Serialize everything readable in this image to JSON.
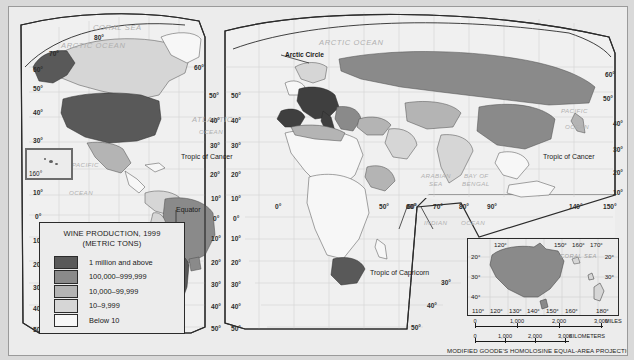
{
  "map": {
    "projection_note": "MODIFIED GOODE'S HOMOLOSINE EQUAL-AREA PROJECTION",
    "legend": {
      "title_line1": "WINE PRODUCTION, 1999",
      "title_line2": "(METRIC TONS)",
      "classes": [
        {
          "label": "1 million and above",
          "color": "#595959"
        },
        {
          "label": "100,000–999,999",
          "color": "#8a8a8a"
        },
        {
          "label": "10,000–99,999",
          "color": "#b4b4b4"
        },
        {
          "label": "10–9,999",
          "color": "#d6d6d6"
        },
        {
          "label": "Below 10",
          "color": "#f7f7f7"
        }
      ]
    },
    "ocean_labels": [
      {
        "text": "ARCTIC OCEAN",
        "x": 52,
        "y": 34
      },
      {
        "text": "ARCTIC OCEAN",
        "x": 310,
        "y": 31
      },
      {
        "text": "ATLANTIC",
        "x": 183,
        "y": 108
      },
      {
        "text": "OCEAN",
        "x": 190,
        "y": 121
      },
      {
        "text": "PACIFIC",
        "x": 63,
        "y": 154
      },
      {
        "text": "OCEAN",
        "x": 60,
        "y": 182
      },
      {
        "text": "PACIFIC",
        "x": 552,
        "y": 100
      },
      {
        "text": "OCEAN",
        "x": 556,
        "y": 116
      },
      {
        "text": "ARABIAN",
        "x": 412,
        "y": 165
      },
      {
        "text": "SEA",
        "x": 420,
        "y": 173
      },
      {
        "text": "BAY OF",
        "x": 455,
        "y": 165
      },
      {
        "text": "BENGAL",
        "x": 453,
        "y": 173
      },
      {
        "text": "INDIAN",
        "x": 415,
        "y": 212
      },
      {
        "text": "OCEAN",
        "x": 452,
        "y": 212
      },
      {
        "text": "CORAL SEA",
        "x": 84,
        "y": 16
      }
    ],
    "place_labels": [
      {
        "text": "Arctic Circle",
        "x": 276,
        "y": 44,
        "bold": true
      },
      {
        "text": "Tropic of Cancer",
        "x": 172,
        "y": 146
      },
      {
        "text": "Tropic of Cancer",
        "x": 534,
        "y": 146
      },
      {
        "text": "Tropic of Capricorn",
        "x": 361,
        "y": 262
      },
      {
        "text": "Equator",
        "x": 167,
        "y": 199
      }
    ],
    "graticule_labels": [
      {
        "text": "80°",
        "x": 85,
        "y": 27
      },
      {
        "text": "70°",
        "x": 40,
        "y": 43
      },
      {
        "text": "60°",
        "x": 24,
        "y": 59
      },
      {
        "text": "50°",
        "x": 24,
        "y": 78
      },
      {
        "text": "40°",
        "x": 24,
        "y": 102
      },
      {
        "text": "30°",
        "x": 24,
        "y": 130
      },
      {
        "text": "160°",
        "x": 18,
        "y": 160
      },
      {
        "text": "10°",
        "x": 24,
        "y": 182
      },
      {
        "text": "0°",
        "x": 26,
        "y": 206
      },
      {
        "text": "10°",
        "x": 24,
        "y": 230
      },
      {
        "text": "20°",
        "x": 24,
        "y": 254
      },
      {
        "text": "30°",
        "x": 24,
        "y": 277
      },
      {
        "text": "40°",
        "x": 24,
        "y": 298
      },
      {
        "text": "50°",
        "x": 24,
        "y": 319
      },
      {
        "text": "60°",
        "x": 185,
        "y": 57
      },
      {
        "text": "50°",
        "x": 200,
        "y": 85
      },
      {
        "text": "40°",
        "x": 201,
        "y": 110
      },
      {
        "text": "30°",
        "x": 201,
        "y": 135
      },
      {
        "text": "20°",
        "x": 201,
        "y": 164
      },
      {
        "text": "10°",
        "x": 202,
        "y": 188
      },
      {
        "text": "0°",
        "x": 204,
        "y": 208
      },
      {
        "text": "10°",
        "x": 202,
        "y": 228
      },
      {
        "text": "20°",
        "x": 202,
        "y": 252
      },
      {
        "text": "30°",
        "x": 202,
        "y": 274
      },
      {
        "text": "40°",
        "x": 202,
        "y": 296
      },
      {
        "text": "50°",
        "x": 202,
        "y": 318
      },
      {
        "text": "50°",
        "x": 222,
        "y": 85
      },
      {
        "text": "40°",
        "x": 222,
        "y": 110
      },
      {
        "text": "30°",
        "x": 222,
        "y": 135
      },
      {
        "text": "20°",
        "x": 222,
        "y": 164
      },
      {
        "text": "10°",
        "x": 222,
        "y": 188
      },
      {
        "text": "0°",
        "x": 224,
        "y": 208
      },
      {
        "text": "10°",
        "x": 222,
        "y": 228
      },
      {
        "text": "20°",
        "x": 222,
        "y": 252
      },
      {
        "text": "30°",
        "x": 222,
        "y": 274
      },
      {
        "text": "40°",
        "x": 222,
        "y": 296
      },
      {
        "text": "50°",
        "x": 222,
        "y": 318
      },
      {
        "text": "0°",
        "x": 266,
        "y": 196
      },
      {
        "text": "50°",
        "x": 370,
        "y": 196
      },
      {
        "text": "60°",
        "x": 398,
        "y": 196
      },
      {
        "text": "60°",
        "x": 397,
        "y": 196
      },
      {
        "text": "70°",
        "x": 424,
        "y": 196
      },
      {
        "text": "80°",
        "x": 450,
        "y": 196
      },
      {
        "text": "90°",
        "x": 478,
        "y": 196
      },
      {
        "text": "140°",
        "x": 560,
        "y": 196
      },
      {
        "text": "150°",
        "x": 594,
        "y": 196
      },
      {
        "text": "60°",
        "x": 596,
        "y": 64
      },
      {
        "text": "50°",
        "x": 594,
        "y": 88
      },
      {
        "text": "40°",
        "x": 604,
        "y": 113
      },
      {
        "text": "30°",
        "x": 604,
        "y": 139
      },
      {
        "text": "20°",
        "x": 604,
        "y": 162
      },
      {
        "text": "10°",
        "x": 604,
        "y": 182
      },
      {
        "text": "30°",
        "x": 432,
        "y": 272
      },
      {
        "text": "40°",
        "x": 418,
        "y": 295
      },
      {
        "text": "50°",
        "x": 402,
        "y": 317
      }
    ],
    "australia_inset": {
      "lon_top": [
        "120°",
        "150°",
        "160°",
        "170°"
      ],
      "lon_bottom": [
        "110°",
        "120°",
        "130°",
        "140°",
        "150°",
        "160°",
        "180°"
      ],
      "lat_left": [
        "20°",
        "30°",
        "40°"
      ],
      "lat_right": [
        "20°",
        "30°"
      ],
      "sea_label": "CORAL SEA"
    },
    "hawaii_inset": {
      "label": "160°"
    },
    "scale": {
      "miles": {
        "ticks": [
          "0",
          "1,000",
          "2,000",
          "3,000"
        ],
        "unit": "MILES"
      },
      "kilometers": {
        "ticks": [
          "0",
          "1,000",
          "2,000",
          "3,000"
        ],
        "unit": "KILOMETERS"
      }
    }
  },
  "chart_data": {
    "type": "map",
    "title": "WINE PRODUCTION, 1999 (METRIC TONS)",
    "classification": "choropleth",
    "legend_classes": [
      {
        "label": "1 million and above",
        "color": "#595959"
      },
      {
        "label": "100,000–999,999",
        "color": "#8a8a8a"
      },
      {
        "label": "10,000–99,999",
        "color": "#b4b4b4"
      },
      {
        "label": "10–9,999",
        "color": "#d6d6d6"
      },
      {
        "label": "Below 10",
        "color": "#f7f7f7"
      }
    ],
    "regions": [
      {
        "name": "United States",
        "class": "1 million and above"
      },
      {
        "name": "France",
        "class": "1 million and above"
      },
      {
        "name": "Italy",
        "class": "1 million and above"
      },
      {
        "name": "Spain",
        "class": "1 million and above"
      },
      {
        "name": "Germany",
        "class": "1 million and above"
      },
      {
        "name": "Argentina",
        "class": "1 million and above"
      },
      {
        "name": "Chile",
        "class": "1 million and above"
      },
      {
        "name": "South Africa",
        "class": "1 million and above"
      },
      {
        "name": "Australia",
        "class": "100,000–999,999"
      },
      {
        "name": "Russia",
        "class": "100,000–999,999"
      },
      {
        "name": "China",
        "class": "100,000–999,999"
      },
      {
        "name": "Brazil",
        "class": "100,000–999,999"
      },
      {
        "name": "Romania",
        "class": "100,000–999,999"
      },
      {
        "name": "Greece",
        "class": "100,000–999,999"
      },
      {
        "name": "Canada",
        "class": "10,000–99,999"
      },
      {
        "name": "Mexico",
        "class": "10,000–99,999"
      },
      {
        "name": "Japan",
        "class": "10,000–99,999"
      },
      {
        "name": "Turkey",
        "class": "10,000–99,999"
      },
      {
        "name": "Algeria",
        "class": "10,000–99,999"
      },
      {
        "name": "Central Africa",
        "class": "Below 10"
      }
    ]
  }
}
